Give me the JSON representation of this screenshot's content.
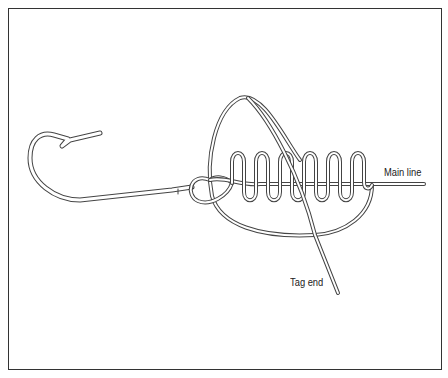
{
  "diagram": {
    "type": "fishing-knot-illustration",
    "labels": {
      "main_line": "Main line",
      "tag_end": "Tag end"
    },
    "elements": [
      "hook",
      "hook-eye",
      "main-line",
      "wraps",
      "large-loop",
      "tag-end"
    ],
    "wrap_count": 5,
    "colors": {
      "line": "#444444",
      "line_fill": "#ffffff",
      "border": "#333333",
      "background": "#ffffff"
    }
  }
}
